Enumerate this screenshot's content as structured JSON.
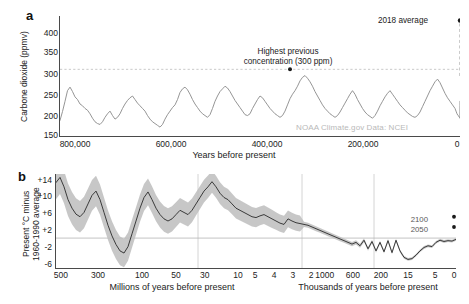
{
  "figure": {
    "panel_a_letter": "a",
    "panel_b_letter": "b"
  },
  "panel_a": {
    "ylabel": "Carbone dioxide (ppmv)",
    "xlabel": "Years before present",
    "yticks": [
      "400",
      "350",
      "300",
      "250",
      "200",
      "150"
    ],
    "xticks": [
      "800,000",
      "600,000",
      "400,000",
      "200,000",
      "0"
    ],
    "annotation_modern": "2018 average",
    "annotation_peak": "Highest previous\nconcentration (300 ppm)",
    "attribution": "NOAA Climate.gov  Data: NCEI",
    "line_color": "#8f8f8f",
    "marker_color": "#1a1a1a"
  },
  "panel_b": {
    "ylabel": "Present °C minus\n1960-1990 average",
    "xlabel_left": "Millions of years before present",
    "xlabel_right": "Thousands of years before present",
    "yticks": [
      "+14",
      "+10",
      "+6",
      "+2",
      "-2",
      "-6"
    ],
    "xticks_left": [
      "500",
      "300",
      "100",
      "50",
      "30",
      "10",
      "5",
      "4",
      "3",
      "2"
    ],
    "xticks_right": [
      "1000",
      "600",
      "200",
      "15",
      "5",
      "0"
    ],
    "projection_2100": "2100",
    "projection_2050": "2050",
    "band_color": "#bdbdbd",
    "line_color": "#2a2a2a",
    "grid_color": "#c9c9c9"
  },
  "chart_data": [
    {
      "type": "line",
      "title": "Carbone dioxide (ppmv) over 800,000 years",
      "xlabel": "Years before present",
      "ylabel": "Carbone dioxide (ppmv)",
      "xlim": [
        800000,
        0
      ],
      "ylim": [
        150,
        420
      ],
      "x_inverted": true,
      "grid": false,
      "reference_line": {
        "y": 300,
        "style": "dotted",
        "label": "Highest previous concentration (300 ppm)"
      },
      "annotations": [
        {
          "text": "2018 average",
          "x": 0,
          "y": 410
        },
        {
          "text": "Highest previous concentration (300 ppm)",
          "x": 340000,
          "y": 300
        }
      ],
      "series": [
        {
          "name": "Atmospheric CO2 (ice core)",
          "x": [
            800000,
            795000,
            790000,
            785000,
            780000,
            775000,
            770000,
            765000,
            760000,
            755000,
            750000,
            745000,
            740000,
            735000,
            730000,
            725000,
            720000,
            715000,
            710000,
            705000,
            700000,
            695000,
            690000,
            685000,
            680000,
            675000,
            670000,
            665000,
            660000,
            655000,
            650000,
            645000,
            640000,
            635000,
            630000,
            625000,
            620000,
            615000,
            610000,
            605000,
            600000,
            595000,
            590000,
            585000,
            580000,
            575000,
            570000,
            565000,
            560000,
            555000,
            550000,
            545000,
            540000,
            535000,
            530000,
            525000,
            520000,
            515000,
            510000,
            505000,
            500000,
            495000,
            490000,
            485000,
            480000,
            475000,
            470000,
            465000,
            460000,
            455000,
            450000,
            445000,
            440000,
            435000,
            430000,
            425000,
            420000,
            415000,
            410000,
            405000,
            400000,
            395000,
            390000,
            385000,
            380000,
            375000,
            370000,
            365000,
            360000,
            355000,
            350000,
            345000,
            340000,
            335000,
            330000,
            325000,
            320000,
            315000,
            310000,
            305000,
            300000,
            295000,
            290000,
            285000,
            280000,
            275000,
            270000,
            265000,
            260000,
            255000,
            250000,
            245000,
            240000,
            235000,
            230000,
            225000,
            220000,
            215000,
            210000,
            205000,
            200000,
            195000,
            190000,
            185000,
            180000,
            175000,
            170000,
            165000,
            160000,
            155000,
            150000,
            145000,
            140000,
            135000,
            130000,
            125000,
            120000,
            115000,
            110000,
            105000,
            100000,
            95000,
            90000,
            85000,
            80000,
            75000,
            70000,
            65000,
            60000,
            55000,
            50000,
            45000,
            40000,
            35000,
            30000,
            25000,
            20000,
            15000,
            10000,
            8000,
            6000,
            4000,
            2000,
            1000,
            500,
            200,
            100,
            50,
            0
          ],
          "y": [
            185,
            205,
            228,
            252,
            260,
            250,
            238,
            232,
            222,
            218,
            212,
            208,
            200,
            190,
            182,
            178,
            176,
            182,
            192,
            200,
            206,
            196,
            188,
            192,
            200,
            212,
            222,
            230,
            236,
            240,
            232,
            224,
            218,
            212,
            206,
            196,
            188,
            182,
            178,
            174,
            170,
            176,
            188,
            198,
            206,
            214,
            220,
            232,
            248,
            256,
            260,
            254,
            244,
            232,
            222,
            214,
            206,
            200,
            196,
            192,
            198,
            212,
            228,
            240,
            250,
            256,
            262,
            258,
            250,
            240,
            230,
            222,
            214,
            206,
            198,
            196,
            200,
            212,
            222,
            232,
            240,
            236,
            228,
            220,
            212,
            206,
            200,
            196,
            192,
            196,
            206,
            220,
            234,
            244,
            252,
            262,
            274,
            282,
            286,
            280,
            272,
            262,
            250,
            240,
            230,
            220,
            212,
            206,
            200,
            196,
            192,
            196,
            204,
            214,
            224,
            234,
            244,
            252,
            244,
            232,
            222,
            212,
            204,
            198,
            194,
            190,
            196,
            206,
            218,
            228,
            238,
            246,
            252,
            244,
            236,
            228,
            220,
            214,
            208,
            202,
            198,
            194,
            192,
            196,
            204,
            216,
            228,
            240,
            252,
            262,
            272,
            278,
            270,
            258,
            246,
            236,
            228,
            220,
            212,
            206,
            200,
            196,
            194,
            192,
            190,
            196,
            206,
            218,
            228,
            238,
            248,
            256,
            262,
            268,
            272,
            278,
            282,
            288,
            300,
            330,
            370,
            400,
            410
          ]
        },
        {
          "name": "2018 average (marker)",
          "x": [
            0
          ],
          "y": [
            410
          ],
          "marker_only": true
        },
        {
          "name": "Highest previous concentration (marker)",
          "x": [
            340000
          ],
          "y": [
            300
          ],
          "marker_only": true
        }
      ]
    },
    {
      "type": "line",
      "title": "Present °C minus 1960-1990 average",
      "xlabel_left": "Millions of years before present",
      "xlabel_right": "Thousands of years before present",
      "ylabel": "Present °C minus 1960-1990 average",
      "ylim": [
        -7,
        15
      ],
      "grid": true,
      "zero_line": true,
      "x_axis_type": "piecewise-compressed",
      "x_segments": [
        {
          "unit": "millions",
          "ticks": [
            500,
            300,
            100
          ]
        },
        {
          "unit": "millions",
          "ticks": [
            50,
            30,
            10,
            5,
            4,
            3,
            2
          ]
        },
        {
          "unit": "thousands",
          "ticks": [
            1000,
            600,
            200
          ]
        },
        {
          "unit": "thousands",
          "ticks": [
            15,
            5,
            0
          ]
        }
      ],
      "series": [
        {
          "name": "Global temperature anomaly (reconstruction)",
          "note": "plotted against compressed time axis, 0..1 normalized positions",
          "xnorm": [
            0.0,
            0.01,
            0.02,
            0.03,
            0.04,
            0.05,
            0.06,
            0.07,
            0.08,
            0.09,
            0.1,
            0.11,
            0.12,
            0.13,
            0.14,
            0.15,
            0.16,
            0.17,
            0.18,
            0.19,
            0.2,
            0.21,
            0.22,
            0.23,
            0.24,
            0.25,
            0.26,
            0.27,
            0.28,
            0.29,
            0.3,
            0.31,
            0.32,
            0.33,
            0.34,
            0.35,
            0.36,
            0.37,
            0.38,
            0.39,
            0.4,
            0.41,
            0.42,
            0.43,
            0.44,
            0.45,
            0.46,
            0.47,
            0.48,
            0.49,
            0.5,
            0.51,
            0.52,
            0.53,
            0.54,
            0.55,
            0.56,
            0.57,
            0.58,
            0.59,
            0.6,
            0.61,
            0.62,
            0.63,
            0.64,
            0.65,
            0.66,
            0.67,
            0.68,
            0.69,
            0.7,
            0.71,
            0.72,
            0.73,
            0.74,
            0.75,
            0.76,
            0.77,
            0.78,
            0.79,
            0.8,
            0.81,
            0.82,
            0.83,
            0.84,
            0.85,
            0.86,
            0.87,
            0.88,
            0.89,
            0.9,
            0.91,
            0.92,
            0.93,
            0.94,
            0.95,
            0.96,
            0.97,
            0.98,
            0.99,
            1.0
          ],
          "y": [
            13.0,
            14.2,
            12.0,
            9.0,
            7.0,
            5.6,
            5.0,
            6.0,
            8.0,
            10.0,
            11.0,
            9.0,
            6.0,
            3.0,
            0.5,
            -1.5,
            -3.0,
            -3.5,
            -2.0,
            1.0,
            4.0,
            7.0,
            9.5,
            10.8,
            9.0,
            7.0,
            5.5,
            4.5,
            4.0,
            4.5,
            5.5,
            6.5,
            6.0,
            5.5,
            6.5,
            8.0,
            9.5,
            11.0,
            12.0,
            13.2,
            12.0,
            10.5,
            9.5,
            9.0,
            8.0,
            7.0,
            6.5,
            6.0,
            5.5,
            5.0,
            4.8,
            5.2,
            5.5,
            5.0,
            4.5,
            4.0,
            3.5,
            3.2,
            4.5,
            4.0,
            3.6,
            3.4,
            3.2,
            3.0,
            2.6,
            2.2,
            1.8,
            1.4,
            1.0,
            0.6,
            0.2,
            -0.2,
            -0.6,
            -1.0,
            -1.4,
            -1.0,
            -1.8,
            -0.5,
            -2.5,
            -0.8,
            -3.0,
            -1.0,
            -3.2,
            -0.6,
            -3.4,
            -0.5,
            -3.0,
            -4.5,
            -5.0,
            -4.8,
            -4.0,
            -3.0,
            -2.2,
            -1.8,
            -2.0,
            -1.0,
            -0.5,
            -0.8,
            -0.6,
            -0.7,
            -0.3
          ],
          "uncertainty_band": true
        },
        {
          "name": "2100 projection (marker)",
          "value": 5.0,
          "marker_only": true
        },
        {
          "name": "2050 projection (marker)",
          "value": 2.6,
          "marker_only": true
        }
      ]
    }
  ]
}
